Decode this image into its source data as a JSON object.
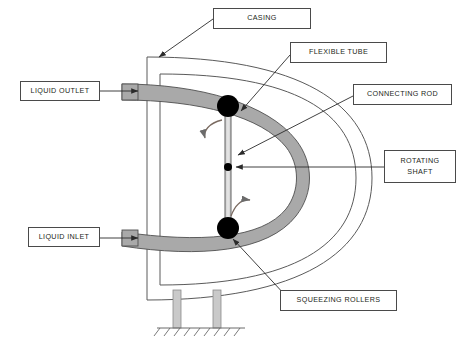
{
  "diagram": {
    "colors": {
      "tube_fill": "#a9a9a9",
      "tube_stroke": "#4f4f4f",
      "roller_fill": "#000000",
      "casing_stroke": "#5a5a5a",
      "leg_fill": "#c9c9c9",
      "label_border": "#4a4a4a",
      "label_text": "#231f20",
      "background": "#ffffff"
    },
    "labels": [
      {
        "id": "casing",
        "text": "CASING",
        "x": 213,
        "y": 8,
        "w": 98,
        "h": 21
      },
      {
        "id": "flexible-tube",
        "text": "FLEXIBLE TUBE",
        "x": 290,
        "y": 42,
        "w": 97,
        "h": 21
      },
      {
        "id": "connecting-rod",
        "text": "CONNECTING ROD",
        "x": 353,
        "y": 84,
        "w": 99,
        "h": 21
      },
      {
        "id": "rotating-shaft",
        "text": "ROTATING\nSHAFT",
        "x": 384,
        "y": 150,
        "w": 72,
        "h": 33
      },
      {
        "id": "liquid-outlet",
        "text": "LIQUID OUTLET",
        "x": 20,
        "y": 81,
        "w": 80,
        "h": 20
      },
      {
        "id": "liquid-inlet",
        "text": "LIQUID INLET",
        "x": 28,
        "y": 227,
        "w": 72,
        "h": 20
      },
      {
        "id": "squeezing-rollers",
        "text": "SQUEEZING ROLLERS",
        "x": 280,
        "y": 290,
        "w": 117,
        "h": 21
      }
    ],
    "components": {
      "top_roller": {
        "cx": 228,
        "cy": 106,
        "r": 11
      },
      "bottom_roller": {
        "cx": 228,
        "cy": 228,
        "r": 11
      },
      "shaft_hub": {
        "cx": 228,
        "cy": 167,
        "r": 4
      },
      "rod": {
        "x": 225,
        "y1": 106,
        "y2": 228,
        "width": 6
      },
      "support_legs": [
        {
          "x": 173,
          "y": 290,
          "w": 8,
          "h": 38
        },
        {
          "x": 213,
          "y": 290,
          "w": 8,
          "h": 38
        }
      ],
      "ground_line": {
        "x1": 157,
        "x2": 245,
        "y": 328
      }
    }
  }
}
